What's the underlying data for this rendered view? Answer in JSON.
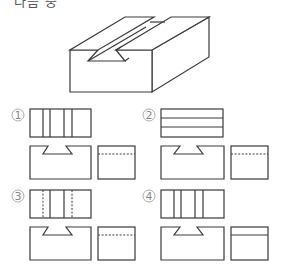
{
  "header": {
    "clipped_text": "다음 중"
  },
  "figure": {
    "name": "isometric block with dovetail groove"
  },
  "options": [
    {
      "label": "①",
      "number": "1",
      "top_view": "three vertical lines pairs (solid)",
      "side_hidden_line": "dashed"
    },
    {
      "label": "②",
      "number": "2",
      "top_view": "two horizontal lines",
      "side_hidden_line": "dashed"
    },
    {
      "label": "③",
      "number": "3",
      "top_view": "outer verticals dashed, inner verticals solid",
      "side_hidden_line": "dashed"
    },
    {
      "label": "④",
      "number": "4",
      "top_view": "four vertical lines (solid)",
      "side_hidden_line": "solid"
    }
  ],
  "colors": {
    "line": "#3a3a3a",
    "label": "#888888",
    "background": "#ffffff"
  }
}
